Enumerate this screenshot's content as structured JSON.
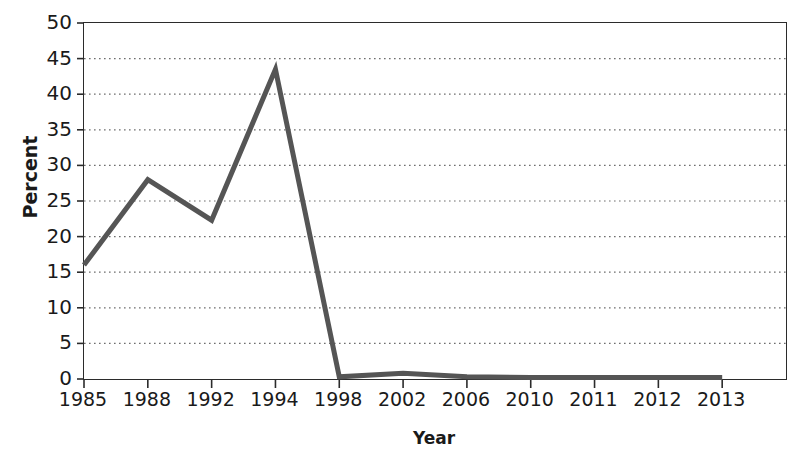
{
  "chart_data": {
    "type": "line",
    "title": "",
    "xlabel": "Year",
    "ylabel": "Percent",
    "categories": [
      "1985",
      "1988",
      "1992",
      "1994",
      "1998",
      "2002",
      "2006",
      "2010",
      "2011",
      "2012",
      "2013"
    ],
    "values": [
      16,
      28,
      22.3,
      43.5,
      0.3,
      0.8,
      0.3,
      0.2,
      0.2,
      0.2,
      0.2
    ],
    "series": [
      {
        "name": "Percent",
        "values": [
          16,
          28,
          22.3,
          43.5,
          0.3,
          0.8,
          0.3,
          0.2,
          0.2,
          0.2,
          0.2
        ]
      }
    ],
    "ylim": [
      0,
      50
    ],
    "yticks": [
      0,
      5,
      10,
      15,
      20,
      25,
      30,
      35,
      40,
      45,
      50
    ],
    "ytick_labels": [
      "0",
      "5",
      "10",
      "15",
      "20",
      "25",
      "30",
      "35",
      "40",
      "45",
      "50"
    ],
    "grid": true,
    "grid_axis": "y",
    "grid_style": "dotted",
    "legend": false,
    "markers": false,
    "line_color": "#555555",
    "line_width": 5,
    "grid_color": "#6e6e6e",
    "frame_color": "#2b2b2b",
    "background": "#ffffff"
  }
}
